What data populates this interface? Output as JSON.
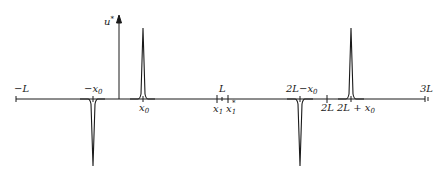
{
  "diagram": {
    "type": "function-plot",
    "axis": {
      "vertical_label": "u*",
      "horizontal_ticks": [
        {
          "id": "minus-L",
          "label": "−L",
          "x": 16
        },
        {
          "id": "minus-x0",
          "label": "−x",
          "sub": "0",
          "x": 93
        },
        {
          "id": "x0",
          "label": "x",
          "sub": "0",
          "x": 143
        },
        {
          "id": "L",
          "label": "L",
          "x": 222
        },
        {
          "id": "x1",
          "label": "x",
          "sub": "1",
          "x": 217
        },
        {
          "id": "x1-star",
          "label": "x",
          "sub": "1",
          "sup": "*",
          "x": 228
        },
        {
          "id": "2L-minus-x0",
          "label": "2L−x",
          "sub": "0",
          "x": 300
        },
        {
          "id": "2L",
          "label": "2L",
          "x": 327
        },
        {
          "id": "2L-plus-x0",
          "label": "2L + x",
          "sub": "0",
          "x": 351
        },
        {
          "id": "3L",
          "label": "3L",
          "x": 425
        }
      ]
    },
    "spikes": [
      {
        "at": "−x0",
        "direction": "down"
      },
      {
        "at": "x0",
        "direction": "up"
      },
      {
        "at": "2L−x0",
        "direction": "down"
      },
      {
        "at": "2L+x0",
        "direction": "up"
      }
    ],
    "labels": {
      "u_star": "u",
      "u_star_sup": "*",
      "minus_L": "−L",
      "minus_x0": "−x",
      "x0": "x",
      "sub0": "0",
      "L": "L",
      "x1": "x",
      "sub1": "1",
      "x1_star": "x",
      "star": "*",
      "two_L_minus_x0": "2L−x",
      "two_L": "2L",
      "two_L_plus_x0": "2L + x",
      "three_L": "3L"
    },
    "colors": {
      "ink": "#1a1a1a",
      "background": "#ffffff"
    }
  }
}
